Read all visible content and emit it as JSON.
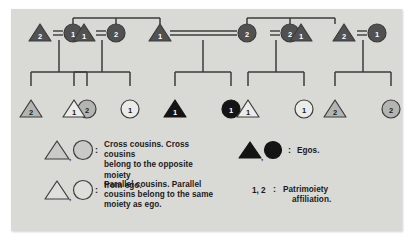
{
  "figure": {
    "panel_color": "#d9d9d6",
    "background_color": "#ffffff",
    "line_color": "#3c3c3c",
    "dark_fill": "#515151",
    "gray_fill": "#b4b4b0",
    "white_fill": "#ebebe8",
    "black_fill": "#141414",
    "symbol_text_color_dark": "#ffffff",
    "symbol_text_color_light": "#1b1b1b"
  },
  "generation1": {
    "label": "Parents generation",
    "nodes": [
      {
        "id": "g1-n1",
        "shape": "triangle",
        "fill": "dark",
        "number": "2",
        "name": "g1-triangle-2-left"
      },
      {
        "id": "g1-n2",
        "shape": "circle",
        "fill": "dark",
        "number": "1",
        "name": "g1-circle-1-a"
      },
      {
        "id": "g1-n3",
        "shape": "triangle",
        "fill": "dark",
        "number": "1",
        "name": "g1-triangle-1-a"
      },
      {
        "id": "g1-n4",
        "shape": "circle",
        "fill": "dark",
        "number": "2",
        "name": "g1-circle-2-a"
      },
      {
        "id": "g1-n5",
        "shape": "triangle",
        "fill": "dark",
        "number": "1",
        "name": "g1-triangle-1-b"
      },
      {
        "id": "g1-n6",
        "shape": "circle",
        "fill": "dark",
        "number": "2",
        "name": "g1-circle-2-b"
      },
      {
        "id": "g1-n7",
        "shape": "circle",
        "fill": "dark",
        "number": "2",
        "name": "g1-circle-2-c"
      },
      {
        "id": "g1-n8",
        "shape": "triangle",
        "fill": "dark",
        "number": "1",
        "name": "g1-triangle-1-c"
      },
      {
        "id": "g1-n9",
        "shape": "triangle",
        "fill": "dark",
        "number": "2",
        "name": "g1-triangle-2-right"
      },
      {
        "id": "g1-n10",
        "shape": "circle",
        "fill": "dark",
        "number": "1",
        "name": "g1-circle-1-b"
      }
    ],
    "marriages": [
      {
        "between": [
          "g1-n1",
          "g1-n2"
        ],
        "name": "marriage-link-1"
      },
      {
        "between": [
          "g1-n3",
          "g1-n4"
        ],
        "name": "marriage-link-2"
      },
      {
        "between": [
          "g1-n5",
          "g1-n6"
        ],
        "name": "marriage-link-center"
      },
      {
        "between": [
          "g1-n7",
          "g1-n8"
        ],
        "name": "marriage-link-3"
      },
      {
        "between": [
          "g1-n9",
          "g1-n10"
        ],
        "name": "marriage-link-4"
      }
    ]
  },
  "generation2": {
    "label": "Ego and cousins generation",
    "nodes": [
      {
        "id": "g2-n1",
        "shape": "triangle",
        "fill": "gray",
        "number": "2",
        "kind": "cross-cousin",
        "name": "g2-cross-triangle-2-left"
      },
      {
        "id": "g2-n2",
        "shape": "circle",
        "fill": "gray",
        "number": "2",
        "kind": "cross-cousin",
        "name": "g2-cross-circle-2-left"
      },
      {
        "id": "g2-n3",
        "shape": "triangle",
        "fill": "white",
        "number": "1",
        "kind": "parallel-cousin",
        "name": "g2-parallel-triangle-1-left"
      },
      {
        "id": "g2-n4",
        "shape": "circle",
        "fill": "white",
        "number": "1",
        "kind": "parallel-cousin",
        "name": "g2-parallel-circle-1-left"
      },
      {
        "id": "g2-n5",
        "shape": "triangle",
        "fill": "black",
        "number": "1",
        "kind": "ego",
        "name": "g2-ego-triangle-1"
      },
      {
        "id": "g2-n6",
        "shape": "circle",
        "fill": "black",
        "number": "1",
        "kind": "ego",
        "name": "g2-ego-circle-1"
      },
      {
        "id": "g2-n7",
        "shape": "triangle",
        "fill": "white",
        "number": "1",
        "kind": "parallel-cousin",
        "name": "g2-parallel-triangle-1-right"
      },
      {
        "id": "g2-n8",
        "shape": "circle",
        "fill": "white",
        "number": "1",
        "kind": "parallel-cousin",
        "name": "g2-parallel-circle-1-right"
      },
      {
        "id": "g2-n9",
        "shape": "triangle",
        "fill": "gray",
        "number": "2",
        "kind": "cross-cousin",
        "name": "g2-cross-triangle-2-right"
      },
      {
        "id": "g2-n10",
        "shape": "circle",
        "fill": "gray",
        "number": "2",
        "kind": "cross-cousin",
        "name": "g2-cross-circle-2-right"
      }
    ]
  },
  "legend": {
    "items": [
      {
        "id": "legend-cross",
        "symbols": [
          "triangle-gray",
          "circle-gray"
        ],
        "separator": ",",
        "colon": ":",
        "text": "Cross cousins. Cross cousins belong to the opposite moiety from ego.",
        "lines": [
          "Cross cousins. Cross cousins",
          "belong to the opposite moiety",
          "from ego."
        ]
      },
      {
        "id": "legend-parallel",
        "symbols": [
          "triangle-white",
          "circle-white"
        ],
        "separator": ",",
        "colon": ":",
        "text": "Parallel cousins. Parallel cousins belong to the same moiety as ego.",
        "lines": [
          "Parallel cousins. Parallel",
          "cousins belong to the same",
          "moiety as ego."
        ]
      },
      {
        "id": "legend-egos",
        "symbols": [
          "triangle-black",
          "circle-black"
        ],
        "separator": ",",
        "colon": ":",
        "text": "Egos.",
        "lines": [
          "Egos."
        ]
      },
      {
        "id": "legend-numbers",
        "symbols": [],
        "key": "1, 2",
        "colon": ":",
        "text": "Patrimoiety affiliation.",
        "lines": [
          "Patrimoiety",
          "affiliation."
        ]
      }
    ]
  }
}
